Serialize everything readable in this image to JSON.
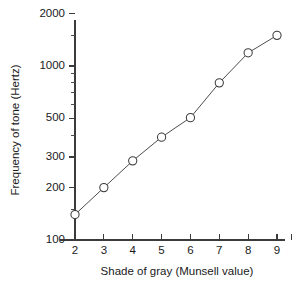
{
  "chart_data": {
    "type": "line",
    "title": "",
    "xlabel": "Shade of gray (Munsell value)",
    "ylabel": "Frequency of tone (Hertz)",
    "x": [
      2,
      3,
      4,
      5,
      6,
      7,
      8,
      9
    ],
    "values": [
      140,
      200,
      285,
      390,
      505,
      800,
      1190,
      1500
    ],
    "series": [
      {
        "name": "Frequency of tone",
        "x": [
          2,
          3,
          4,
          5,
          6,
          7,
          8,
          9
        ],
        "values": [
          140,
          200,
          285,
          390,
          505,
          800,
          1190,
          1500
        ]
      }
    ],
    "xlim": [
      1.65,
      9.7
    ],
    "ylim": [
      100,
      2000
    ],
    "yscale": "log",
    "xscale": "linear",
    "grid": false,
    "legend": false,
    "marker": "open-circle",
    "line_color": "#4d4d4d",
    "marker_face_color": "#ffffff",
    "marker_edge_color": "#3d3d3d",
    "y_tick_labels": [
      "2000",
      "1000",
      "500",
      "300",
      "200",
      "100"
    ],
    "y_tick_values": [
      2000,
      1000,
      500,
      300,
      200,
      100
    ],
    "y_minor_ticks": [
      1500,
      900,
      800,
      700,
      600,
      400,
      150
    ],
    "x_tick_labels": [
      "2",
      "3",
      "4",
      "5",
      "6",
      "7",
      "8",
      "9"
    ],
    "x_tick_values": [
      2,
      3,
      4,
      5,
      6,
      7,
      8,
      9
    ],
    "x_extra_tick_unlabeled": 9.5
  },
  "axes": {
    "x_title": "Shade of gray (Munsell value)",
    "y_title": "Frequency of tone (Hertz)"
  }
}
